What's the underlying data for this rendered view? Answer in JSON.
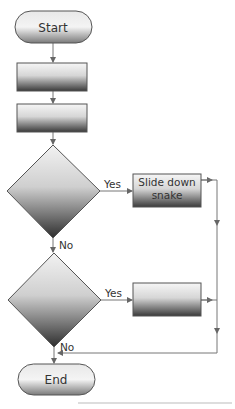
{
  "diagram": {
    "type": "flowchart",
    "nodes": {
      "start": {
        "label": "Start",
        "shape": "terminator"
      },
      "process1": {
        "label": "",
        "shape": "process"
      },
      "process2": {
        "label": "",
        "shape": "process"
      },
      "decision1": {
        "label": "",
        "shape": "decision"
      },
      "slide": {
        "label_line1": "Slide down",
        "label_line2": "snake",
        "shape": "process"
      },
      "decision2": {
        "label": "",
        "shape": "decision"
      },
      "process3": {
        "label": "",
        "shape": "process"
      },
      "end": {
        "label": "End",
        "shape": "terminator"
      }
    },
    "edges": {
      "d1_yes": "Yes",
      "d1_no": "No",
      "d2_yes": "Yes",
      "d2_no": "No"
    },
    "colors": {
      "stroke": "#555555",
      "line": "#777777",
      "grad_top": "#f4f4f4",
      "grad_bottom": "#3a3a3a"
    }
  }
}
